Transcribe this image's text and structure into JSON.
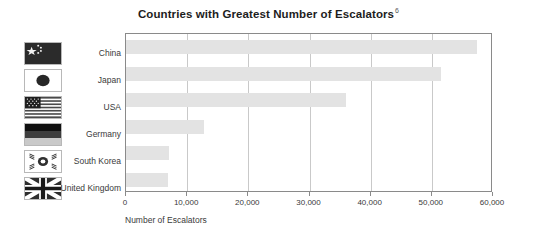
{
  "chart_data": {
    "type": "bar",
    "orientation": "horizontal",
    "title": "Countries with Greatest Number of Escalators",
    "title_superscript": "6",
    "xlabel": "Number of Escalators",
    "ylabel": "",
    "categories": [
      "China",
      "Japan",
      "USA",
      "Germany",
      "South Korea",
      "United Kingdom"
    ],
    "values": [
      57400,
      51500,
      36000,
      12800,
      7000,
      6900
    ],
    "xlim": [
      0,
      60000
    ],
    "xticks": [
      0,
      10000,
      20000,
      30000,
      40000,
      50000,
      60000
    ],
    "xtick_labels": [
      "0",
      "10,000",
      "20,000",
      "30,000",
      "40,000",
      "50,000",
      "60,000"
    ],
    "grid": true,
    "grid_axis": "x",
    "legend": false,
    "bar_color": "#e3e3e3",
    "axis_color": "#8a8a8a",
    "grid_color": "#c9c9c9",
    "text_color": "#333333"
  },
  "flags": [
    {
      "country": "China",
      "icon": "flag-china-icon"
    },
    {
      "country": "Japan",
      "icon": "flag-japan-icon"
    },
    {
      "country": "USA",
      "icon": "flag-usa-icon"
    },
    {
      "country": "Germany",
      "icon": "flag-germany-icon"
    },
    {
      "country": "South Korea",
      "icon": "flag-south-korea-icon"
    },
    {
      "country": "United Kingdom",
      "icon": "flag-united-kingdom-icon"
    }
  ]
}
